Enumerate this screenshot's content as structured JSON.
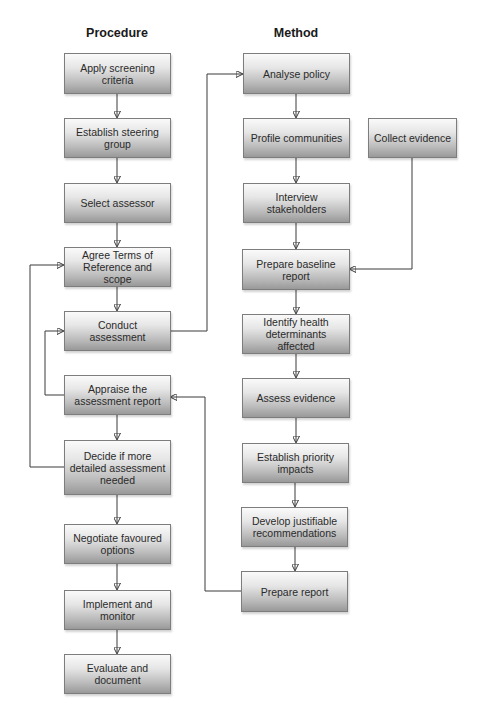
{
  "columns": {
    "procedure": {
      "title": "Procedure",
      "steps": [
        "Apply screening criteria",
        "Establish steering group",
        "Select assessor",
        "Agree Terms of Reference and scope",
        "Conduct assessment",
        "Appraise the assessment report",
        "Decide if more detailed assessment needed",
        "Negotiate favoured options",
        "Implement and monitor",
        "Evaluate and document"
      ]
    },
    "method": {
      "title": "Method",
      "steps": [
        "Analyse policy",
        "Profile communities",
        "Interview stakeholders",
        "Prepare baseline report",
        "Identify health determinants affected",
        "Assess evidence",
        "Establish priority impacts",
        "Develop justifiable recommendations",
        "Prepare report"
      ],
      "side_input": "Collect evidence"
    }
  },
  "connections": [
    {
      "from": "Apply screening criteria",
      "to": "Establish steering group"
    },
    {
      "from": "Establish steering group",
      "to": "Select assessor"
    },
    {
      "from": "Select assessor",
      "to": "Agree Terms of Reference and scope"
    },
    {
      "from": "Agree Terms of Reference and scope",
      "to": "Conduct assessment"
    },
    {
      "from": "Conduct assessment",
      "to": "Analyse policy"
    },
    {
      "from": "Appraise the assessment report",
      "to": "Conduct assessment"
    },
    {
      "from": "Appraise the assessment report",
      "to": "Decide if more detailed assessment needed"
    },
    {
      "from": "Decide if more detailed assessment needed",
      "to": "Agree Terms of Reference and scope"
    },
    {
      "from": "Decide if more detailed assessment needed",
      "to": "Negotiate favoured options"
    },
    {
      "from": "Negotiate favoured options",
      "to": "Implement and monitor"
    },
    {
      "from": "Implement and monitor",
      "to": "Evaluate and document"
    },
    {
      "from": "Analyse policy",
      "to": "Profile communities"
    },
    {
      "from": "Profile communities",
      "to": "Interview stakeholders"
    },
    {
      "from": "Interview stakeholders",
      "to": "Prepare baseline report"
    },
    {
      "from": "Collect evidence",
      "to": "Prepare baseline report"
    },
    {
      "from": "Prepare baseline report",
      "to": "Identify health determinants affected"
    },
    {
      "from": "Identify health determinants affected",
      "to": "Assess evidence"
    },
    {
      "from": "Assess evidence",
      "to": "Establish priority impacts"
    },
    {
      "from": "Establish priority impacts",
      "to": "Develop justifiable recommendations"
    },
    {
      "from": "Develop justifiable recommendations",
      "to": "Prepare report"
    },
    {
      "from": "Prepare report",
      "to": "Appraise the assessment report"
    }
  ],
  "colors": {
    "box_top": "#fafafa",
    "box_bottom": "#999999",
    "border": "#7d7d7d",
    "line": "#3a3a3a",
    "text": "#2a2a2a"
  }
}
